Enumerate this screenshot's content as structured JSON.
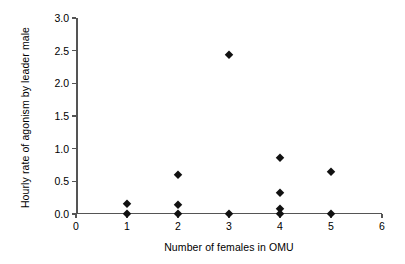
{
  "chart_data": {
    "type": "scatter",
    "title": "",
    "xlabel": "Number of females in OMU",
    "ylabel": "Hourly rate of agonism by leader male",
    "xlim": [
      0,
      6
    ],
    "ylim": [
      0.0,
      3.0
    ],
    "grid": false,
    "legend": null,
    "marker": "diamond",
    "marker_color": "#111111",
    "xticks": [
      "0",
      "1",
      "2",
      "3",
      "4",
      "5",
      "6"
    ],
    "xtick_values": [
      0,
      1,
      2,
      3,
      4,
      5,
      6
    ],
    "yticks": [
      "0.0",
      "0.5",
      "1.0",
      "1.5",
      "2.0",
      "2.5",
      "3.0"
    ],
    "ytick_values": [
      0.0,
      0.5,
      1.0,
      1.5,
      2.0,
      2.5,
      3.0
    ],
    "points": [
      {
        "x": 1,
        "y": 0.15
      },
      {
        "x": 1,
        "y": 0.0
      },
      {
        "x": 2,
        "y": 0.59
      },
      {
        "x": 2,
        "y": 0.14
      },
      {
        "x": 2,
        "y": 0.0
      },
      {
        "x": 3,
        "y": 2.44
      },
      {
        "x": 3,
        "y": 0.0
      },
      {
        "x": 4,
        "y": 0.86
      },
      {
        "x": 4,
        "y": 0.32
      },
      {
        "x": 4,
        "y": 0.07
      },
      {
        "x": 4,
        "y": 0.0
      },
      {
        "x": 5,
        "y": 0.64
      },
      {
        "x": 5,
        "y": 0.0
      }
    ]
  }
}
